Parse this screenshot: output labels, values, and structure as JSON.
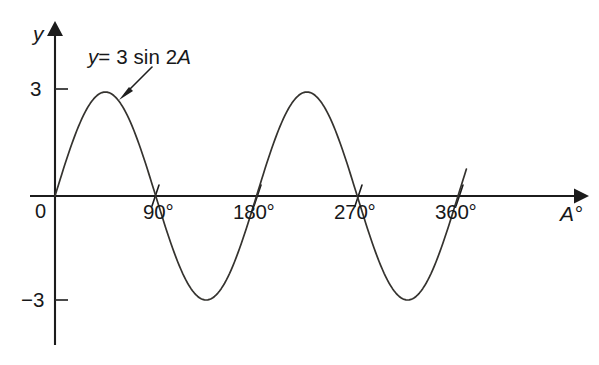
{
  "figure": {
    "background_color": "#ffffff",
    "ink_color": "#1c1c1c",
    "curve_color": "#35332f"
  },
  "labels": {
    "y_axis_name": "y",
    "x_axis_name": "A°",
    "origin": "0",
    "equation_y": "y",
    "equation_rest": "= 3 sin 2",
    "equation_var": "A",
    "equation_full": "y = 3 sin 2A"
  },
  "axes": {
    "y_ticks": [
      "3",
      "−3"
    ],
    "x_ticks": [
      "90°",
      "180°",
      "270°",
      "360°"
    ]
  },
  "chart_data": {
    "type": "line",
    "title": "",
    "subtitle": "",
    "xlabel": "A°",
    "ylabel": "y",
    "grid": false,
    "legend": false,
    "annotations": [
      {
        "text": "y = 3 sin 2A",
        "points_to_degrees": 60,
        "points_to_value": 2.6
      }
    ],
    "xlim": [
      0,
      390
    ],
    "ylim": [
      -3.6,
      3.6
    ],
    "xticks": [
      0,
      90,
      180,
      270,
      360
    ],
    "xticklabels": [
      "0",
      "90°",
      "180°",
      "270°",
      "360°"
    ],
    "yticks": [
      3,
      -3
    ],
    "yticklabels": [
      "3",
      "−3"
    ],
    "series": [
      {
        "name": "y = 3 sin 2A",
        "equation": "y = 3 sin 2A",
        "amplitude": 3,
        "period_degrees": 180,
        "cycles_shown": 2,
        "x": [
          0,
          15,
          30,
          45,
          60,
          75,
          90,
          105,
          120,
          135,
          150,
          165,
          180,
          195,
          210,
          225,
          240,
          255,
          270,
          285,
          300,
          315,
          330,
          345,
          360
        ],
        "values": [
          0,
          1.5,
          2.6,
          3,
          2.6,
          1.5,
          0,
          -1.5,
          -2.6,
          -3,
          -2.6,
          -1.5,
          0,
          1.5,
          2.6,
          3,
          2.6,
          1.5,
          0,
          -1.5,
          -2.6,
          -3,
          -2.6,
          -1.5,
          0
        ],
        "key_points": {
          "zeros_degrees": [
            0,
            90,
            180,
            270,
            360
          ],
          "maxima_degrees": [
            45,
            225
          ],
          "maxima_value": 3,
          "minima_degrees": [
            135,
            315
          ],
          "minima_value": -3
        }
      }
    ]
  }
}
